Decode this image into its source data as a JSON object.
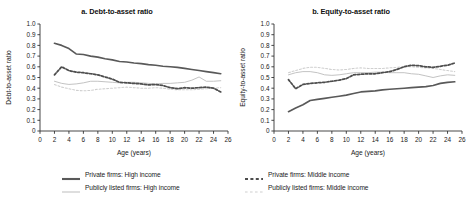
{
  "figure": {
    "width": 468,
    "height": 203,
    "background": "#ffffff"
  },
  "colors": {
    "private_high": "#595959",
    "private_middle": "#4d4d4d",
    "listed_high": "#c3c3c3",
    "listed_middle": "#cfcfcf",
    "axis": "#333333",
    "text": "#1a1a1a"
  },
  "legend": {
    "items": [
      {
        "label": "Private firms: High income",
        "series": "private_high",
        "style": "solid",
        "weight": "thick",
        "color": "#595959"
      },
      {
        "label": "Private firms: Middle income",
        "series": "private_middle",
        "style": "dashed",
        "weight": "thick",
        "color": "#4d4d4d"
      },
      {
        "label": "Publicly listed firms: High income",
        "series": "listed_high",
        "style": "solid",
        "weight": "thin",
        "color": "#c3c3c3"
      },
      {
        "label": "Publicly listed firms: Middle income",
        "series": "listed_middle",
        "style": "dashed",
        "weight": "thin",
        "color": "#cfcfcf"
      }
    ]
  },
  "chart_data": [
    {
      "type": "line",
      "panel": "a",
      "title": "a. Debt-to-asset ratio",
      "xlabel": "Age (years)",
      "ylabel": "Debt-to-asset ratio",
      "xlim": [
        0,
        26
      ],
      "ylim": [
        0,
        1.0
      ],
      "xticks": [
        0,
        2,
        4,
        6,
        8,
        10,
        12,
        14,
        16,
        18,
        20,
        22,
        24,
        26
      ],
      "xticklabels": [
        "0",
        "2",
        "4",
        "6",
        "8",
        "10",
        "12",
        "14",
        "16",
        "18",
        "20",
        "22",
        "24",
        "26"
      ],
      "yticks": [
        0,
        0.1,
        0.2,
        0.3,
        0.4,
        0.5,
        0.6,
        0.7,
        0.8,
        0.9,
        1.0
      ],
      "yticklabels": [
        "0",
        "0.1",
        "0.2",
        "0.3",
        "0.4",
        "0.5",
        "0.6",
        "0.7",
        "0.8",
        "0.9",
        "1.0"
      ],
      "grid": false,
      "legend_position": "below-figure",
      "x": [
        2,
        3,
        4,
        5,
        6,
        7,
        8,
        9,
        10,
        11,
        12,
        13,
        14,
        15,
        16,
        17,
        18,
        19,
        20,
        21,
        22,
        23,
        24,
        25
      ],
      "series": [
        {
          "name": "Private firms: High income",
          "key": "private_high",
          "values": [
            0.82,
            0.8,
            0.77,
            0.72,
            0.715,
            0.7,
            0.69,
            0.675,
            0.665,
            0.65,
            0.645,
            0.635,
            0.63,
            0.62,
            0.615,
            0.605,
            0.6,
            0.595,
            0.585,
            0.575,
            0.565,
            0.555,
            0.545,
            0.535
          ]
        },
        {
          "name": "Private firms: Middle income",
          "key": "private_middle",
          "values": [
            0.525,
            0.6,
            0.565,
            0.55,
            0.545,
            0.535,
            0.525,
            0.505,
            0.485,
            0.455,
            0.45,
            0.445,
            0.44,
            0.43,
            0.435,
            0.425,
            0.405,
            0.395,
            0.405,
            0.4,
            0.405,
            0.41,
            0.4,
            0.365
          ]
        },
        {
          "name": "Publicly listed firms: High income",
          "key": "listed_high",
          "values": [
            0.465,
            0.445,
            0.435,
            0.44,
            0.45,
            0.465,
            0.465,
            0.46,
            0.455,
            0.45,
            0.455,
            0.455,
            0.45,
            0.445,
            0.44,
            0.445,
            0.445,
            0.45,
            0.455,
            0.475,
            0.505,
            0.465,
            0.465,
            0.47
          ]
        },
        {
          "name": "Publicly listed firms: Middle income",
          "key": "listed_middle",
          "values": [
            0.435,
            0.41,
            0.395,
            0.38,
            0.375,
            0.38,
            0.39,
            0.395,
            0.4,
            0.405,
            0.41,
            0.405,
            0.4,
            0.4,
            0.405,
            0.4,
            0.39,
            0.385,
            0.385,
            0.385,
            0.39,
            0.395,
            0.4,
            0.405
          ]
        }
      ]
    },
    {
      "type": "line",
      "panel": "b",
      "title": "b. Equity-to-asset ratio",
      "xlabel": "Age (years)",
      "ylabel": "Equity-to-asset ratio",
      "xlim": [
        0,
        26
      ],
      "ylim": [
        0,
        1.0
      ],
      "xticks": [
        0,
        2,
        4,
        6,
        8,
        10,
        12,
        14,
        16,
        18,
        20,
        22,
        24,
        26
      ],
      "xticklabels": [
        "0",
        "2",
        "4",
        "6",
        "8",
        "10",
        "12",
        "14",
        "16",
        "18",
        "20",
        "22",
        "24",
        "26"
      ],
      "yticks": [
        0,
        0.1,
        0.2,
        0.3,
        0.4,
        0.5,
        0.6,
        0.7,
        0.8,
        0.9,
        1.0
      ],
      "yticklabels": [
        "0",
        "0.1",
        "0.2",
        "0.3",
        "0.4",
        "0.5",
        "0.6",
        "0.7",
        "0.8",
        "0.9",
        "1.0"
      ],
      "grid": false,
      "legend_position": "below-figure",
      "x": [
        2,
        3,
        4,
        5,
        6,
        7,
        8,
        9,
        10,
        11,
        12,
        13,
        14,
        15,
        16,
        17,
        18,
        19,
        20,
        21,
        22,
        23,
        24,
        25
      ],
      "series": [
        {
          "name": "Private firms: High income",
          "key": "private_high",
          "values": [
            0.18,
            0.215,
            0.245,
            0.285,
            0.295,
            0.305,
            0.315,
            0.325,
            0.335,
            0.35,
            0.365,
            0.37,
            0.375,
            0.385,
            0.39,
            0.395,
            0.4,
            0.405,
            0.41,
            0.415,
            0.425,
            0.445,
            0.455,
            0.46
          ]
        },
        {
          "name": "Private firms: Middle income",
          "key": "private_middle",
          "values": [
            0.48,
            0.395,
            0.435,
            0.445,
            0.45,
            0.455,
            0.465,
            0.475,
            0.49,
            0.525,
            0.53,
            0.535,
            0.535,
            0.545,
            0.555,
            0.575,
            0.6,
            0.615,
            0.61,
            0.6,
            0.595,
            0.605,
            0.615,
            0.635
          ]
        },
        {
          "name": "Publicly listed firms: High income",
          "key": "listed_high",
          "values": [
            0.525,
            0.545,
            0.555,
            0.555,
            0.545,
            0.525,
            0.52,
            0.525,
            0.535,
            0.545,
            0.545,
            0.545,
            0.55,
            0.55,
            0.545,
            0.545,
            0.545,
            0.535,
            0.53,
            0.515,
            0.5,
            0.515,
            0.525,
            0.52
          ]
        },
        {
          "name": "Publicly listed firms: Middle income",
          "key": "listed_middle",
          "values": [
            0.545,
            0.565,
            0.585,
            0.595,
            0.595,
            0.585,
            0.575,
            0.57,
            0.575,
            0.585,
            0.59,
            0.585,
            0.585,
            0.585,
            0.59,
            0.595,
            0.6,
            0.6,
            0.595,
            0.59,
            0.585,
            0.575,
            0.565,
            0.555
          ]
        }
      ]
    }
  ]
}
